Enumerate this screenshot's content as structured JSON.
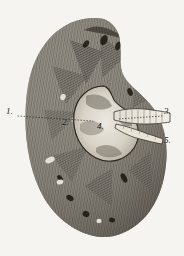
{
  "plate": {
    "title": "Kidney, longitudinal section",
    "medium": "engraving",
    "background_color": "#fbfaf7",
    "ink_color": "#1a1713",
    "width": 184,
    "height": 256
  },
  "labels": [
    {
      "id": "label-1",
      "text": "1.",
      "x": 6,
      "y": 112,
      "target": "cortex (outer substance)",
      "leader": true,
      "placement": "left-margin"
    },
    {
      "id": "label-2",
      "text": "2.",
      "x": 62,
      "y": 122,
      "target": "medullary / tubular substance",
      "leader": false,
      "placement": "on-image"
    },
    {
      "id": "label-3",
      "text": "3.",
      "x": 164,
      "y": 112,
      "target": "renal vein / vessel",
      "leader": true,
      "placement": "right-margin"
    },
    {
      "id": "label-4",
      "text": "4.",
      "x": 97,
      "y": 127,
      "target": "renal pelvis / sinus",
      "leader": false,
      "placement": "on-image"
    },
    {
      "id": "label-5",
      "text": "5.",
      "x": 164,
      "y": 140,
      "target": "ureter",
      "leader": false,
      "placement": "right-margin"
    }
  ],
  "leaders": [
    {
      "id": "leader-1",
      "from_x": 18,
      "from_y": 116,
      "to_x": 93,
      "to_y": 121,
      "style": "dotted"
    },
    {
      "id": "leader-3",
      "from_x": 162,
      "from_y": 116,
      "to_x": 118,
      "to_y": 120,
      "style": "dotted"
    }
  ],
  "figure_parts": [
    {
      "name": "capsule-outline",
      "description": "bean-shaped organ outline, convex left border, concave right hilum"
    },
    {
      "name": "cortex",
      "description": "finely radially hatched outer zone"
    },
    {
      "name": "medullary-pyramids",
      "description": "dark triangular zones converging on the sinus"
    },
    {
      "name": "renal-sinus",
      "description": "pale central cavity with papillae"
    },
    {
      "name": "renal-vessel",
      "description": "horizontally hatched tube leaving hilum toward upper right"
    },
    {
      "name": "ureter",
      "description": "narrow tube leaving hilum toward lower right"
    }
  ]
}
